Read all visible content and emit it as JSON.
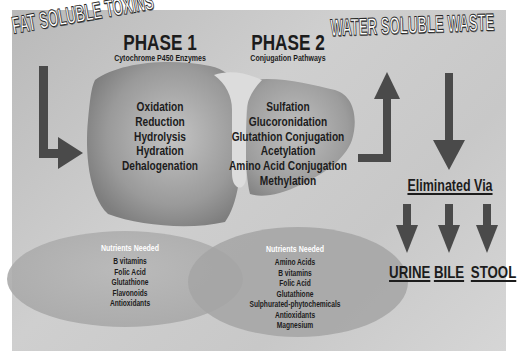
{
  "titles": {
    "input": "FAT SOLUBLE TOXINS",
    "output": "WATER SOLUBLE WASTE"
  },
  "phase1": {
    "title": "PHASE 1",
    "subtitle": "Cytochrome P450 Enzymes",
    "items": [
      "Oxidation",
      "Reduction",
      "Hydrolysis",
      "Hydration",
      "Dehalogenation"
    ],
    "nutrients_title": "Nutrients Needed",
    "nutrients": [
      "B vitamins",
      "Folic Acid",
      "Glutathione",
      "Flavonoids",
      "Antioxidants"
    ]
  },
  "phase2": {
    "title": "PHASE 2",
    "subtitle": "Conjugation Pathways",
    "items": [
      "Sulfation",
      "Glucoronidation",
      "Glutathion Conjugation",
      "Acetylation",
      "Amino Acid Conjugation",
      "Methylation"
    ],
    "nutrients_title": "Nutrients Needed",
    "nutrients": [
      "Amino Acids",
      "B vitamins",
      "Folic Acid",
      "Glutathione",
      "Sulphurated-phytochemicals",
      "Antioxidants",
      "Magnesium"
    ]
  },
  "elimination": {
    "title": "Eliminated Via",
    "routes": [
      "URINE",
      "BILE",
      "STOOL"
    ]
  },
  "colors": {
    "arrow": "#4a4a4a",
    "text": "#1c1c1c",
    "panel": "#c8c8c8",
    "liver": "#8f8f8f"
  }
}
